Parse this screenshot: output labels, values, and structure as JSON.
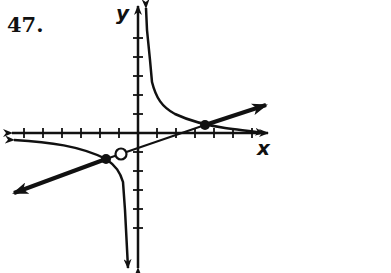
{
  "problem": {
    "number": "47."
  },
  "axes": {
    "x_label": "x",
    "y_label": "y",
    "origin_px": [
      138,
      133
    ],
    "tick_spacing_px": 19,
    "x_ticks_left": 6,
    "x_ticks_right": 6,
    "y_ticks_up": 5,
    "y_ticks_down": 6
  },
  "graph": {
    "description": "Rational function with vertical asymptote near x = -0.5, slant asymptote line y = 0.4x - 0.3 (approx), hole on the line, and two intersection points marked with filled dots",
    "features": {
      "line": "slant asymptote / line with arrows at both ends",
      "hole": "open circle on the line just left of y-axis",
      "intersection_points": [
        "filled dot at right (~3.5, 0.4)",
        "filled dot at left (~-1.7, -1.3)"
      ],
      "upper_branch": "approaches vertical asymptote upward, decays to x-axis on right",
      "lower_branch": "approaches x-axis from below on left, descends along vertical asymptote"
    },
    "colors": {
      "ink": "#111111",
      "background": "#ffffff"
    }
  }
}
